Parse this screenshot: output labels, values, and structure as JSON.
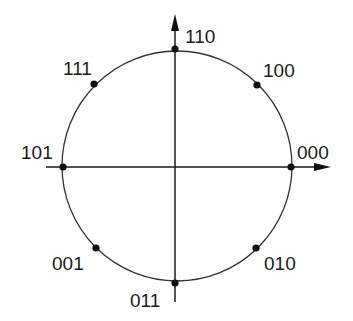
{
  "diagram": {
    "title": "",
    "type": "8-PSK constellation",
    "colors": {
      "line": "#333333",
      "point": "#111111",
      "text": "#1a1a1a",
      "background": "#ffffff"
    },
    "circle": {
      "cx": 177,
      "cy": 166,
      "r": 115
    },
    "axes": {
      "horizontal": {
        "x1": 46,
        "y1": 167,
        "x2": 322,
        "y2": 167,
        "arrow_tip_x": 331
      },
      "vertical": {
        "x1": 175,
        "y1": 302,
        "x2": 175,
        "y2": 24,
        "arrow_tip_y": 14
      }
    },
    "points": [
      {
        "label": "000",
        "x": 291,
        "y": 167,
        "label_x": 297,
        "label_y": 159
      },
      {
        "label": "100",
        "x": 257,
        "y": 85,
        "label_x": 263,
        "label_y": 77
      },
      {
        "label": "110",
        "x": 175,
        "y": 49,
        "label_x": 185,
        "label_y": 43
      },
      {
        "label": "111",
        "x": 94,
        "y": 84,
        "label_x": 63,
        "label_y": 75
      },
      {
        "label": "101",
        "x": 63,
        "y": 167,
        "label_x": 21,
        "label_y": 159
      },
      {
        "label": "001",
        "x": 96,
        "y": 248,
        "label_x": 52,
        "label_y": 270
      },
      {
        "label": "011",
        "x": 175,
        "y": 283,
        "label_x": 130,
        "label_y": 307
      },
      {
        "label": "010",
        "x": 256,
        "y": 248,
        "label_x": 264,
        "label_y": 270
      }
    ]
  }
}
